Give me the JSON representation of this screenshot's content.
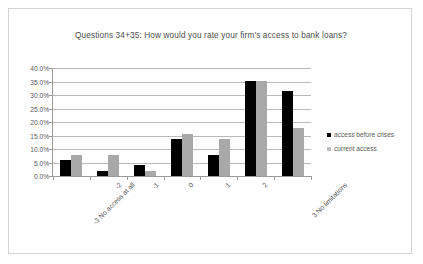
{
  "chart_data": {
    "type": "bar",
    "title": "Questions 34+35: How would you rate your firm's access to bank loans?",
    "xlabel": "",
    "ylabel": "",
    "categories": [
      "-3 No access at all",
      "-2",
      "-1",
      "0",
      "1",
      "2",
      "3 No limitations"
    ],
    "series": [
      {
        "name": "access before crises",
        "color": "#000000",
        "values": [
          5.9,
          2.0,
          3.9,
          13.7,
          7.8,
          35.3,
          31.4
        ]
      },
      {
        "name": "current access",
        "color": "#a8a8a8",
        "values": [
          7.8,
          7.8,
          2.0,
          15.7,
          13.7,
          35.3,
          17.6
        ]
      }
    ],
    "ylim": [
      0,
      40
    ],
    "ytick_values": [
      0,
      5,
      10,
      15,
      20,
      25,
      30,
      35,
      40
    ],
    "ytick_labels": [
      "0.0%",
      "5.0%",
      "10.0%",
      "15.0%",
      "20.0%",
      "25.0%",
      "30.0%",
      "35.0%",
      "40.0%"
    ],
    "grid": true,
    "legend_position": "right"
  }
}
